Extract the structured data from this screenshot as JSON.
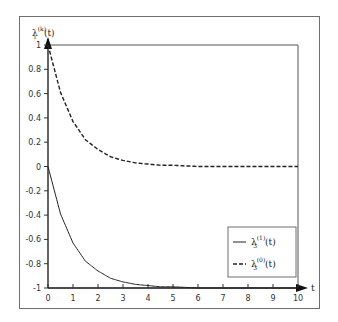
{
  "chart_data": {
    "type": "line",
    "title": "",
    "xlabel": "t",
    "ylabel": "λ_i^(k)(t)",
    "xlim": [
      0,
      10
    ],
    "ylim": [
      -1,
      1
    ],
    "grid": false,
    "legend_position": "lower right",
    "x_ticks": [
      "0",
      "1",
      "2",
      "3",
      "4",
      "5",
      "6",
      "7",
      "8",
      "9",
      "10"
    ],
    "y_ticks": [
      "1",
      "0.8",
      "0.6",
      "0.4",
      "0.2",
      "0",
      "-0.2",
      "-0.4",
      "-0.6",
      "-0.8",
      "-1"
    ],
    "x": [
      0,
      0.5,
      1,
      1.5,
      2,
      2.5,
      3,
      3.5,
      4,
      4.5,
      5,
      6,
      7,
      8,
      9,
      10
    ],
    "series": [
      {
        "name": "λ_3^(1)(t)",
        "style": "solid",
        "values": [
          0,
          -0.39,
          -0.63,
          -0.78,
          -0.86,
          -0.92,
          -0.95,
          -0.97,
          -0.98,
          -0.99,
          -0.99,
          -1.0,
          -1.0,
          -1.0,
          -1.0,
          -1.0
        ]
      },
      {
        "name": "λ_3^(0)(t)",
        "style": "dashed",
        "values": [
          1,
          0.61,
          0.37,
          0.22,
          0.14,
          0.08,
          0.05,
          0.03,
          0.02,
          0.01,
          0.01,
          0.0,
          0.0,
          0.0,
          0.0,
          0.0
        ]
      }
    ]
  },
  "labels": {
    "y_axis_main": "λ",
    "y_axis_sup": "(k)",
    "y_axis_sub": "i",
    "y_axis_arg": "(t)",
    "x_axis": "t",
    "legend": [
      {
        "main": "λ",
        "sub": "3",
        "sup": "(1)",
        "arg": "(t)",
        "style": "solid"
      },
      {
        "main": "λ",
        "sub": "3",
        "sup": "(0)",
        "arg": "(t)",
        "style": "dashed"
      }
    ]
  }
}
